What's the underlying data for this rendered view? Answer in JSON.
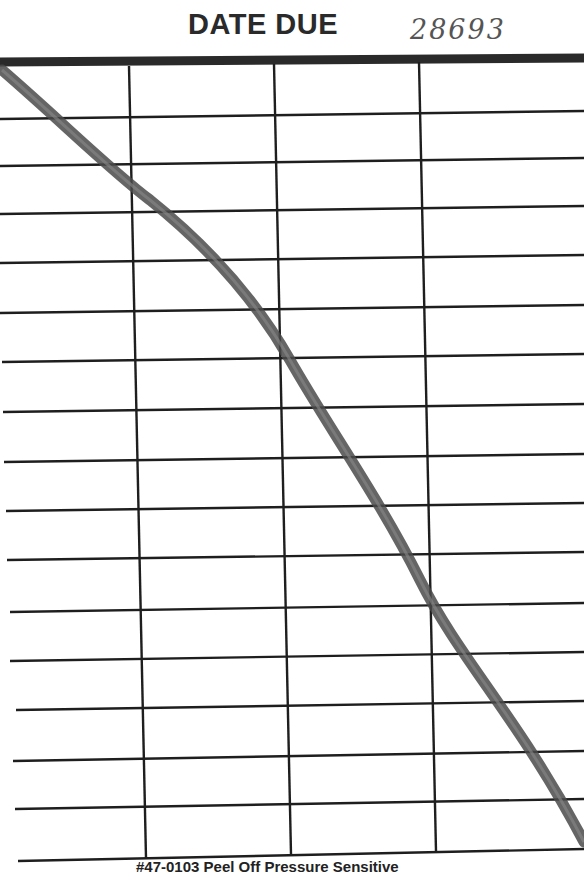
{
  "card": {
    "title": "DATE DUE",
    "handwritten_number": "28693",
    "footer": "#47-0103 Peel Off Pressure Sensitive",
    "columns": 4,
    "rows": 16,
    "row_entries": [
      "",
      "",
      "",
      "",
      "",
      "",
      "",
      "",
      "",
      "",
      "",
      "",
      "",
      "",
      "",
      ""
    ],
    "strike_line": "diagonal pencil line from top-left to bottom-right, cancelling all entries"
  },
  "colors": {
    "paper": "#ffffff",
    "ink": "#222222",
    "pencil": "#555555"
  }
}
